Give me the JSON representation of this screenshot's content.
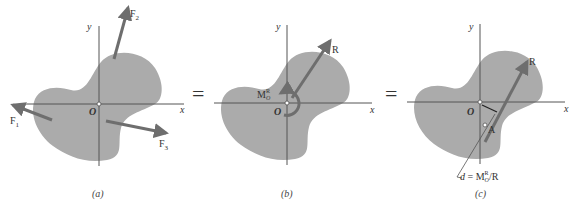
{
  "colors": {
    "body_fill": "#ababab",
    "axis": "#555555",
    "arrow": "#6e6e6e",
    "text": "#333333",
    "background": "#ffffff"
  },
  "equals_sign": "=",
  "panels": [
    {
      "caption": "(a)",
      "axes": {
        "x_label": "x",
        "y_label": "y",
        "origin_label": "O"
      },
      "forces": [
        {
          "name": "F",
          "subscript": "1"
        },
        {
          "name": "F",
          "subscript": "2"
        },
        {
          "name": "F",
          "subscript": "3"
        }
      ]
    },
    {
      "caption": "(b)",
      "axes": {
        "x_label": "x",
        "y_label": "y",
        "origin_label": "O"
      },
      "resultant_label": "R",
      "moment_label": {
        "name": "M",
        "superscript": "R",
        "subscript": "O"
      }
    },
    {
      "caption": "(c)",
      "axes": {
        "x_label": "x",
        "y_label": "y",
        "origin_label": "O"
      },
      "resultant_label": "R",
      "point_label": "A",
      "distance_label": {
        "lhs": "d",
        "eq": " = ",
        "name": "M",
        "superscript": "R",
        "subscript": "O",
        "rhs": "/R"
      }
    }
  ]
}
